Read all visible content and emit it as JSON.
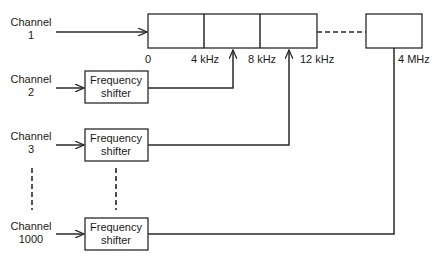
{
  "diagram": {
    "type": "frequency-division-multiplexing",
    "channels": [
      {
        "line1": "Channel",
        "line2": "1",
        "shifted": false
      },
      {
        "line1": "Channel",
        "line2": "2",
        "shifted": true
      },
      {
        "line1": "Channel",
        "line2": "3",
        "shifted": true
      },
      {
        "line1": "Channel",
        "line2": "1000",
        "shifted": true
      }
    ],
    "shifter": {
      "line1": "Frequency",
      "line2": "shifter"
    },
    "band_labels": [
      "0",
      "4 kHz",
      "8 kHz",
      "12 kHz",
      "4 MHz"
    ],
    "colors": {
      "stroke": "#2a2a2a",
      "text": "#1a1a1a",
      "background": "#ffffff"
    }
  }
}
